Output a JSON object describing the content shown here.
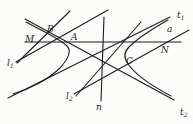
{
  "figure": {
    "background": "#fcfcfb",
    "stroke_color": "#1c1c1c",
    "stroke_width": 1.1,
    "label_font_size": 9,
    "sub_font_size": 6,
    "lines": [
      {
        "name": "line-t1-asymptote",
        "x1": 8,
        "y1": 98,
        "x2": 170,
        "y2": 17
      },
      {
        "name": "line-t2-asymptote",
        "x1": 25,
        "y1": 19,
        "x2": 174,
        "y2": 100
      },
      {
        "name": "line-chord-MN",
        "x1": 25,
        "y1": 42,
        "x2": 181,
        "y2": 42
      },
      {
        "name": "line-n",
        "x1": 104,
        "y1": 17,
        "x2": 101,
        "y2": 101
      },
      {
        "name": "line-l1",
        "x1": 17,
        "y1": 63,
        "x2": 70,
        "y2": 11
      },
      {
        "name": "line-l1-companion",
        "x1": 16,
        "y1": 62,
        "x2": 108,
        "y2": 10
      },
      {
        "name": "line-l2",
        "x1": 76,
        "y1": 96,
        "x2": 141,
        "y2": 22
      },
      {
        "name": "line-a",
        "x1": 74,
        "y1": 94,
        "x2": 189,
        "y2": 30
      }
    ],
    "curves": [
      {
        "name": "hyperbola-left-branch",
        "d": "M 26 22 C 44 32, 60 39, 67 46 C 72 51, 69 58, 60 68 C 49 79, 30 89, 13 94"
      },
      {
        "name": "hyperbola-right-branch",
        "d": "M 168 20 C 152 29, 138 38, 129 47 C 124 52, 123 57, 128 64 C 135 74, 152 86, 171 96"
      }
    ],
    "labels": [
      {
        "name": "label-t1",
        "base": "t",
        "sub": "1",
        "x": 177,
        "y": 18
      },
      {
        "name": "label-a",
        "base": "a",
        "sub": "",
        "x": 167,
        "y": 32
      },
      {
        "name": "label-N",
        "base": "N",
        "sub": "",
        "x": 161,
        "y": 53
      },
      {
        "name": "label-C",
        "base": "C",
        "sub": "",
        "x": 126,
        "y": 64
      },
      {
        "name": "label-t2",
        "base": "t",
        "sub": "2",
        "x": 180,
        "y": 115
      },
      {
        "name": "label-n",
        "base": "n",
        "sub": "",
        "x": 96,
        "y": 110
      },
      {
        "name": "label-l2",
        "base": "l",
        "sub": "2",
        "x": 66,
        "y": 99
      },
      {
        "name": "label-l1",
        "base": "l",
        "sub": "1",
        "x": 7,
        "y": 66
      },
      {
        "name": "label-M",
        "base": "M",
        "sub": "",
        "x": 25,
        "y": 42
      },
      {
        "name": "label-B",
        "base": "B",
        "sub": "",
        "x": 47,
        "y": 32
      },
      {
        "name": "label-A",
        "base": "A",
        "sub": "",
        "x": 71,
        "y": 40
      }
    ]
  }
}
